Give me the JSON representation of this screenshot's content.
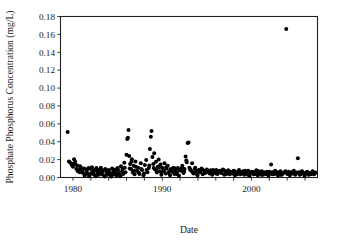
{
  "chart_data": {
    "type": "scatter",
    "title": "",
    "xlabel": "Date",
    "ylabel": "Phosphate Phosphorus Concentration (mg/L)",
    "xlim": [
      1978.6,
      2007.4
    ],
    "ylim": [
      0.0,
      0.18
    ],
    "grid": false,
    "legend": null,
    "marker": {
      "shape": "circle",
      "color": "#000000",
      "size_px": 2.0
    },
    "yticks": [
      0.0,
      0.02,
      0.04,
      0.06,
      0.08,
      0.1,
      0.12,
      0.14,
      0.16,
      0.18
    ],
    "ytick_labels": [
      "0.00",
      "0.02",
      "0.04",
      "0.06",
      "0.08",
      "0.10",
      "0.12",
      "0.14",
      "0.16",
      "0.18"
    ],
    "xticks_major": [
      1980,
      1990,
      2000
    ],
    "xtick_labels": [
      "1980",
      "1990",
      "2000"
    ],
    "xticks_minor": [
      1982,
      1984,
      1986,
      1988,
      1992,
      1994,
      1996,
      1998,
      2002,
      2004,
      2006
    ],
    "notable_points": [
      {
        "x": 1979.4,
        "y": 0.051,
        "note": "early outlier"
      },
      {
        "x": 2003.9,
        "y": 0.166,
        "note": "maximum outlier"
      },
      {
        "x": 1986.2,
        "y": 0.053,
        "note": "mid-1980s peak"
      },
      {
        "x": 1988.8,
        "y": 0.052,
        "note": "late-1980s peak"
      },
      {
        "x": 1992.9,
        "y": 0.039,
        "note": "early-1990s peak"
      }
    ],
    "points": [
      [
        1979.4,
        0.051
      ],
      [
        1979.55,
        0.018
      ],
      [
        1979.7,
        0.0165
      ],
      [
        1979.85,
        0.014
      ],
      [
        1980.0,
        0.012
      ],
      [
        1980.12,
        0.0205
      ],
      [
        1980.25,
        0.0175
      ],
      [
        1980.38,
        0.0095
      ],
      [
        1980.5,
        0.013
      ],
      [
        1980.62,
        0.0085
      ],
      [
        1980.75,
        0.006
      ],
      [
        1980.88,
        0.011
      ],
      [
        1981.0,
        0.0075
      ],
      [
        1981.12,
        0.005
      ],
      [
        1981.25,
        0.01
      ],
      [
        1981.38,
        0.0035
      ],
      [
        1981.5,
        0.009
      ],
      [
        1981.62,
        0.0045
      ],
      [
        1981.75,
        0.0105
      ],
      [
        1981.88,
        0.003
      ],
      [
        1982.0,
        0.0095
      ],
      [
        1982.12,
        0.0115
      ],
      [
        1982.25,
        0.004
      ],
      [
        1982.38,
        0.0085
      ],
      [
        1982.5,
        0.0025
      ],
      [
        1982.62,
        0.0105
      ],
      [
        1982.75,
        0.006
      ],
      [
        1982.88,
        0.003
      ],
      [
        1983.0,
        0.009
      ],
      [
        1983.12,
        0.011
      ],
      [
        1983.25,
        0.0035
      ],
      [
        1983.38,
        0.008
      ],
      [
        1983.5,
        0.002
      ],
      [
        1983.62,
        0.0095
      ],
      [
        1983.75,
        0.0055
      ],
      [
        1983.88,
        0.003
      ],
      [
        1984.0,
        0.0085
      ],
      [
        1984.12,
        0.0045
      ],
      [
        1984.25,
        0.0025
      ],
      [
        1984.38,
        0.01
      ],
      [
        1984.5,
        0.006
      ],
      [
        1984.62,
        0.0035
      ],
      [
        1984.75,
        0.009
      ],
      [
        1984.88,
        0.002
      ],
      [
        1985.0,
        0.0105
      ],
      [
        1985.12,
        0.005
      ],
      [
        1985.25,
        0.003
      ],
      [
        1985.38,
        0.0125
      ],
      [
        1985.5,
        0.007
      ],
      [
        1985.62,
        0.004
      ],
      [
        1985.75,
        0.0165
      ],
      [
        1985.88,
        0.006
      ],
      [
        1986.0,
        0.0255
      ],
      [
        1986.08,
        0.043
      ],
      [
        1986.16,
        0.0445
      ],
      [
        1986.22,
        0.053
      ],
      [
        1986.3,
        0.024
      ],
      [
        1986.4,
        0.015
      ],
      [
        1986.5,
        0.0095
      ],
      [
        1986.6,
        0.0205
      ],
      [
        1986.7,
        0.006
      ],
      [
        1986.8,
        0.013
      ],
      [
        1986.9,
        0.0035
      ],
      [
        1987.0,
        0.018
      ],
      [
        1987.15,
        0.0075
      ],
      [
        1987.3,
        0.011
      ],
      [
        1987.45,
        0.004
      ],
      [
        1987.6,
        0.016
      ],
      [
        1987.75,
        0.0085
      ],
      [
        1987.9,
        0.0025
      ],
      [
        1988.05,
        0.014
      ],
      [
        1988.2,
        0.0195
      ],
      [
        1988.35,
        0.006
      ],
      [
        1988.5,
        0.0105
      ],
      [
        1988.62,
        0.032
      ],
      [
        1988.72,
        0.0455
      ],
      [
        1988.8,
        0.052
      ],
      [
        1988.9,
        0.023
      ],
      [
        1989.0,
        0.015
      ],
      [
        1989.1,
        0.027
      ],
      [
        1989.2,
        0.009
      ],
      [
        1989.3,
        0.0175
      ],
      [
        1989.4,
        0.0055
      ],
      [
        1989.5,
        0.012
      ],
      [
        1989.6,
        0.02
      ],
      [
        1989.7,
        0.007
      ],
      [
        1989.8,
        0.0145
      ],
      [
        1989.9,
        0.003
      ],
      [
        1990.0,
        0.011
      ],
      [
        1990.12,
        0.0085
      ],
      [
        1990.25,
        0.016
      ],
      [
        1990.38,
        0.0045
      ],
      [
        1990.5,
        0.01
      ],
      [
        1990.62,
        0.013
      ],
      [
        1990.75,
        0.0065
      ],
      [
        1990.88,
        0.0025
      ],
      [
        1991.0,
        0.0095
      ],
      [
        1991.12,
        0.007
      ],
      [
        1991.25,
        0.011
      ],
      [
        1991.38,
        0.004
      ],
      [
        1991.5,
        0.0085
      ],
      [
        1991.62,
        0.0055
      ],
      [
        1991.75,
        0.0105
      ],
      [
        1991.88,
        0.002
      ],
      [
        1992.0,
        0.009
      ],
      [
        1992.12,
        0.0075
      ],
      [
        1992.25,
        0.013
      ],
      [
        1992.38,
        0.005
      ],
      [
        1992.5,
        0.0095
      ],
      [
        1992.62,
        0.0235
      ],
      [
        1992.75,
        0.017
      ],
      [
        1992.85,
        0.0385
      ],
      [
        1992.95,
        0.039
      ],
      [
        1993.05,
        0.011
      ],
      [
        1993.2,
        0.008
      ],
      [
        1993.35,
        0.016
      ],
      [
        1993.5,
        0.0045
      ],
      [
        1993.65,
        0.0095
      ],
      [
        1993.8,
        0.007
      ],
      [
        1993.95,
        0.0025
      ],
      [
        1994.1,
        0.0085
      ],
      [
        1994.25,
        0.006
      ],
      [
        1994.4,
        0.01
      ],
      [
        1994.55,
        0.0035
      ],
      [
        1994.7,
        0.0075
      ],
      [
        1994.85,
        0.0055
      ],
      [
        1995.0,
        0.009
      ],
      [
        1995.15,
        0.0065
      ],
      [
        1995.3,
        0.0045
      ],
      [
        1995.45,
        0.008
      ],
      [
        1995.6,
        0.003
      ],
      [
        1995.75,
        0.007
      ],
      [
        1995.9,
        0.0055
      ],
      [
        1996.05,
        0.0085
      ],
      [
        1996.2,
        0.004
      ],
      [
        1996.35,
        0.0065
      ],
      [
        1996.5,
        0.0075
      ],
      [
        1996.65,
        0.005
      ],
      [
        1996.8,
        0.009
      ],
      [
        1996.95,
        0.003
      ],
      [
        1997.1,
        0.007
      ],
      [
        1997.25,
        0.0055
      ],
      [
        1997.4,
        0.008
      ],
      [
        1997.55,
        0.0035
      ],
      [
        1997.7,
        0.0065
      ],
      [
        1997.85,
        0.0045
      ],
      [
        1998.0,
        0.0075
      ],
      [
        1998.15,
        0.0025
      ],
      [
        1998.3,
        0.006
      ],
      [
        1998.45,
        0.005
      ],
      [
        1998.6,
        0.0085
      ],
      [
        1998.75,
        0.0035
      ],
      [
        1998.9,
        0.0055
      ],
      [
        1999.05,
        0.007
      ],
      [
        1999.2,
        0.003
      ],
      [
        1999.35,
        0.006
      ],
      [
        1999.5,
        0.0045
      ],
      [
        1999.65,
        0.0075
      ],
      [
        1999.8,
        0.002
      ],
      [
        1999.95,
        0.0055
      ],
      [
        2000.1,
        0.0065
      ],
      [
        2000.25,
        0.0035
      ],
      [
        2000.4,
        0.005
      ],
      [
        2000.55,
        0.008
      ],
      [
        2000.7,
        0.0025
      ],
      [
        2000.85,
        0.006
      ],
      [
        2001.0,
        0.0045
      ],
      [
        2001.15,
        0.007
      ],
      [
        2001.3,
        0.003
      ],
      [
        2001.45,
        0.0055
      ],
      [
        2001.6,
        0.004
      ],
      [
        2001.75,
        0.0065
      ],
      [
        2001.9,
        0.002
      ],
      [
        2002.05,
        0.005
      ],
      [
        2002.2,
        0.0145
      ],
      [
        2002.35,
        0.006
      ],
      [
        2002.5,
        0.0035
      ],
      [
        2002.65,
        0.0075
      ],
      [
        2002.8,
        0.0045
      ],
      [
        2002.95,
        0.0025
      ],
      [
        2003.1,
        0.0055
      ],
      [
        2003.25,
        0.007
      ],
      [
        2003.4,
        0.003
      ],
      [
        2003.55,
        0.005
      ],
      [
        2003.7,
        0.006
      ],
      [
        2003.9,
        0.166
      ],
      [
        2004.0,
        0.004
      ],
      [
        2004.15,
        0.0065
      ],
      [
        2004.3,
        0.0025
      ],
      [
        2004.45,
        0.0055
      ],
      [
        2004.6,
        0.0045
      ],
      [
        2004.75,
        0.0075
      ],
      [
        2004.9,
        0.003
      ],
      [
        2005.05,
        0.005
      ],
      [
        2005.2,
        0.0215
      ],
      [
        2005.35,
        0.006
      ],
      [
        2005.5,
        0.0035
      ],
      [
        2005.65,
        0.007
      ],
      [
        2005.8,
        0.0045
      ],
      [
        2005.95,
        0.002
      ],
      [
        2006.1,
        0.0055
      ],
      [
        2006.25,
        0.0065
      ],
      [
        2006.4,
        0.003
      ],
      [
        2006.55,
        0.005
      ],
      [
        2006.7,
        0.004
      ],
      [
        2006.85,
        0.007
      ],
      [
        2007.0,
        0.0035
      ],
      [
        2007.15,
        0.0055
      ],
      [
        1980.05,
        0.0155
      ],
      [
        1980.3,
        0.0145
      ],
      [
        1980.55,
        0.007
      ],
      [
        1980.8,
        0.0125
      ],
      [
        1981.05,
        0.0065
      ],
      [
        1981.3,
        0.002
      ],
      [
        1981.55,
        0.0075
      ],
      [
        1981.8,
        0.0015
      ],
      [
        1982.05,
        0.005
      ],
      [
        1982.3,
        0.007
      ],
      [
        1982.55,
        0.0015
      ],
      [
        1982.8,
        0.008
      ],
      [
        1983.05,
        0.005
      ],
      [
        1983.3,
        0.0065
      ],
      [
        1983.55,
        0.001
      ],
      [
        1983.8,
        0.0075
      ],
      [
        1984.05,
        0.0065
      ],
      [
        1984.3,
        0.001
      ],
      [
        1984.55,
        0.008
      ],
      [
        1984.8,
        0.005
      ],
      [
        1985.05,
        0.0085
      ],
      [
        1985.3,
        0.0015
      ],
      [
        1985.55,
        0.0095
      ],
      [
        1985.8,
        0.011
      ],
      [
        1986.35,
        0.01
      ],
      [
        1986.55,
        0.0175
      ],
      [
        1986.85,
        0.0075
      ],
      [
        1987.05,
        0.012
      ],
      [
        1987.35,
        0.0055
      ],
      [
        1987.65,
        0.0095
      ],
      [
        1987.95,
        0.0045
      ],
      [
        1988.25,
        0.0085
      ],
      [
        1988.55,
        0.0135
      ],
      [
        1989.05,
        0.0105
      ],
      [
        1989.35,
        0.008
      ],
      [
        1989.65,
        0.0115
      ],
      [
        1989.95,
        0.006
      ],
      [
        1990.2,
        0.0075
      ],
      [
        1990.45,
        0.0115
      ],
      [
        1990.7,
        0.005
      ],
      [
        1990.95,
        0.009
      ],
      [
        1991.2,
        0.006
      ],
      [
        1991.45,
        0.01
      ],
      [
        1991.7,
        0.0035
      ],
      [
        1991.95,
        0.008
      ],
      [
        1992.2,
        0.0105
      ],
      [
        1992.45,
        0.0065
      ],
      [
        1992.7,
        0.019
      ],
      [
        1993.15,
        0.009
      ],
      [
        1993.4,
        0.006
      ],
      [
        1993.7,
        0.011
      ],
      [
        1993.9,
        0.004
      ],
      [
        1994.2,
        0.007
      ],
      [
        1994.5,
        0.009
      ],
      [
        1994.8,
        0.005
      ],
      [
        1995.1,
        0.0075
      ],
      [
        1995.4,
        0.006
      ],
      [
        1995.7,
        0.0085
      ],
      [
        1996.0,
        0.0045
      ],
      [
        1996.3,
        0.007
      ],
      [
        1996.6,
        0.0055
      ],
      [
        1996.9,
        0.008
      ],
      [
        1997.2,
        0.004
      ],
      [
        1997.5,
        0.0065
      ],
      [
        1997.8,
        0.005
      ],
      [
        1998.1,
        0.007
      ],
      [
        1998.4,
        0.0035
      ],
      [
        1998.7,
        0.006
      ],
      [
        1999.0,
        0.0045
      ],
      [
        1999.3,
        0.0075
      ],
      [
        1999.6,
        0.003
      ],
      [
        1999.9,
        0.0055
      ],
      [
        2000.2,
        0.006
      ],
      [
        2000.5,
        0.004
      ],
      [
        2000.8,
        0.007
      ],
      [
        2001.1,
        0.003
      ],
      [
        2001.4,
        0.0055
      ],
      [
        2001.7,
        0.0045
      ],
      [
        2002.0,
        0.0065
      ],
      [
        2002.3,
        0.0035
      ],
      [
        2002.6,
        0.005
      ],
      [
        2002.9,
        0.006
      ],
      [
        2003.2,
        0.003
      ],
      [
        2003.5,
        0.0045
      ],
      [
        2003.8,
        0.007
      ],
      [
        2004.2,
        0.0035
      ],
      [
        2004.5,
        0.006
      ],
      [
        2004.8,
        0.0045
      ],
      [
        2005.1,
        0.0055
      ],
      [
        2005.4,
        0.003
      ],
      [
        2005.7,
        0.0065
      ],
      [
        2006.0,
        0.004
      ],
      [
        2006.3,
        0.0055
      ],
      [
        2006.6,
        0.0035
      ],
      [
        2006.9,
        0.006
      ],
      [
        2007.1,
        0.0045
      ]
    ]
  }
}
